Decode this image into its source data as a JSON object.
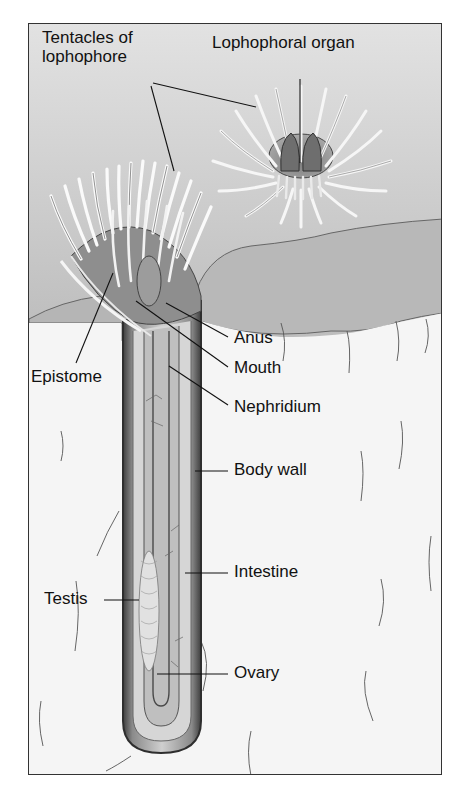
{
  "figure": {
    "type": "anatomical-illustration",
    "labels": {
      "tentacles": "Tentacles of\nlophophore",
      "tentacles_line1": "Tentacles of",
      "tentacles_line2": "lophophore",
      "lophophoral_organ": "Lophophoral organ",
      "anus": "Anus",
      "mouth": "Mouth",
      "epistome": "Epistome",
      "nephridium": "Nephridium",
      "body_wall": "Body wall",
      "intestine": "Intestine",
      "testis": "Testis",
      "ovary": "Ovary"
    },
    "colors": {
      "water": "#d4d4d4",
      "sediment_surface": "#bdbdbd",
      "sediment": "#f4f4f4",
      "tube_outer": "#555555",
      "tube_inner": "#c8c8c8",
      "tentacle": "#ececec",
      "leader_line": "#111111",
      "frame_border": "#333333"
    }
  }
}
